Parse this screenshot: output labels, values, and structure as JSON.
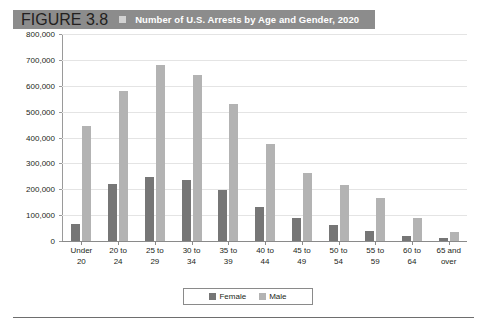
{
  "header": {
    "figure_label": "FIGURE 3.8",
    "bullet_icon": "square-bullet-icon",
    "title": "Number of U.S. Arrests by Age and Gender, 2020",
    "bar_color": "#8c8c8c",
    "text_color": "#ffffff"
  },
  "legend": {
    "position": "bottom-center",
    "entries": [
      {
        "label": "Female",
        "color": "#767676"
      },
      {
        "label": "Male",
        "color": "#b3b3b3"
      }
    ]
  },
  "chart_data": {
    "type": "bar",
    "title": "Number of U.S. Arrests by Age and Gender, 2020",
    "xlabel": "",
    "ylabel": "",
    "ylim": [
      0,
      800000
    ],
    "ytick_step": 100000,
    "grid": true,
    "legend_position": "bottom-center",
    "categories": [
      "Under\n20",
      "20 to\n24",
      "25 to\n29",
      "30 to\n34",
      "35 to\n39",
      "40 to\n44",
      "45 to\n49",
      "50 to\n54",
      "55 to\n59",
      "60 to\n64",
      "65 and\nover"
    ],
    "ytick_labels": [
      "800,000",
      "700,000",
      "600,000",
      "500,000",
      "400,000",
      "300,000",
      "200,000",
      "100,000",
      "0"
    ],
    "series": [
      {
        "name": "Female",
        "color": "#767676",
        "values": [
          65000,
          222000,
          246000,
          237000,
          197000,
          132000,
          88000,
          62000,
          40000,
          18000,
          12000
        ]
      },
      {
        "name": "Male",
        "color": "#b3b3b3",
        "values": [
          445000,
          578000,
          680000,
          643000,
          528000,
          375000,
          263000,
          215000,
          165000,
          88000,
          35000
        ]
      }
    ]
  }
}
